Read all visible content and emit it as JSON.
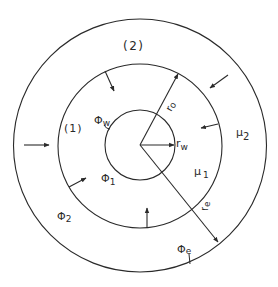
{
  "diagram": {
    "type": "concentric-circles-radial-flow",
    "center": [
      140,
      145
    ],
    "circles": [
      {
        "name": "well",
        "radius": 35
      },
      {
        "name": "inner-region-boundary",
        "radius": 82
      },
      {
        "name": "outer-boundary",
        "radius": 126
      }
    ],
    "colors": {
      "line": "#2a2a2a",
      "background": "#ffffff"
    }
  },
  "labels": {
    "region_2": "(2)",
    "region_1": "(1)",
    "phi_w": "Φ",
    "phi_w_sub": "w",
    "phi_1": "Φ",
    "phi_1_sub": "1",
    "phi_2": "Φ",
    "phi_2_sub": "2",
    "phi_e": "Φ",
    "phi_e_sub": "e",
    "mu_1": "μ",
    "mu_1_sub": "1",
    "mu_2": "μ",
    "mu_2_sub": "2",
    "r_w": "r",
    "r_w_sub": "w",
    "r_o": "r",
    "r_o_sub": "o",
    "r_e": "r",
    "r_e_sub": "e"
  }
}
